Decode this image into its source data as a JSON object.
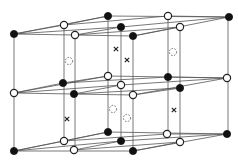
{
  "diagram": {
    "title": "",
    "colors": {
      "background": "#ffffff",
      "line": "#555555",
      "filled": "#111111",
      "open_fill": "#ffffff"
    },
    "radius": 3.6,
    "verticals": [
      {
        "x": 14,
        "y1": 34,
        "y2": 151
      },
      {
        "x": 64,
        "y1": 25,
        "y2": 141
      },
      {
        "x": 75,
        "y1": 35,
        "y2": 150
      },
      {
        "x": 108,
        "y1": 16,
        "y2": 132
      },
      {
        "x": 121,
        "y1": 27,
        "y2": 141
      },
      {
        "x": 133,
        "y1": 36,
        "y2": 151
      },
      {
        "x": 168,
        "y1": 16,
        "y2": 134
      },
      {
        "x": 180,
        "y1": 27,
        "y2": 142
      },
      {
        "x": 228,
        "y1": 17,
        "y2": 134
      }
    ],
    "layers": [
      {
        "name": "top",
        "lines": [
          [
            14,
            34,
            108,
            16
          ],
          [
            14,
            34,
            121,
            27
          ],
          [
            14,
            34,
            133,
            36
          ],
          [
            64,
            25,
            168,
            16
          ],
          [
            75,
            35,
            180,
            27
          ],
          [
            108,
            16,
            229,
            17
          ],
          [
            121,
            27,
            229,
            17
          ],
          [
            133,
            36,
            229,
            17
          ],
          [
            14,
            34,
            64,
            25
          ],
          [
            64,
            25,
            108,
            16
          ],
          [
            75,
            35,
            121,
            27
          ],
          [
            133,
            36,
            180,
            27
          ],
          [
            168,
            16,
            229,
            17
          ]
        ]
      },
      {
        "name": "middle",
        "lines": [
          [
            14,
            93,
            108,
            76
          ],
          [
            14,
            93,
            121,
            85
          ],
          [
            14,
            93,
            133,
            95
          ],
          [
            63,
            83,
            168,
            77
          ],
          [
            74,
            94,
            180,
            88
          ],
          [
            108,
            76,
            227,
            78
          ],
          [
            121,
            85,
            227,
            78
          ],
          [
            133,
            95,
            227,
            78
          ],
          [
            14,
            93,
            63,
            83
          ],
          [
            63,
            83,
            108,
            76
          ],
          [
            74,
            94,
            121,
            85
          ],
          [
            133,
            95,
            180,
            88
          ],
          [
            168,
            77,
            227,
            78
          ]
        ]
      },
      {
        "name": "bottom",
        "lines": [
          [
            14,
            151,
            108,
            132
          ],
          [
            14,
            151,
            121,
            141
          ],
          [
            14,
            151,
            133,
            151
          ],
          [
            64,
            141,
            167,
            134
          ],
          [
            74,
            150,
            180,
            142
          ],
          [
            108,
            132,
            227,
            134
          ],
          [
            121,
            141,
            227,
            134
          ],
          [
            133,
            151,
            227,
            134
          ],
          [
            14,
            151,
            64,
            141
          ],
          [
            64,
            141,
            108,
            132
          ],
          [
            74,
            150,
            121,
            141
          ],
          [
            133,
            151,
            180,
            142
          ],
          [
            167,
            134,
            227,
            134
          ]
        ]
      }
    ],
    "atoms_filled": [
      [
        14,
        34
      ],
      [
        108,
        16
      ],
      [
        121,
        27
      ],
      [
        133,
        36
      ],
      [
        229,
        17
      ],
      [
        63,
        83
      ],
      [
        74,
        94
      ],
      [
        168,
        77
      ],
      [
        180,
        88
      ],
      [
        14,
        151
      ],
      [
        108,
        132
      ],
      [
        121,
        141
      ],
      [
        133,
        151
      ],
      [
        227,
        134
      ]
    ],
    "atoms_open": [
      [
        64,
        25
      ],
      [
        75,
        35
      ],
      [
        168,
        16
      ],
      [
        180,
        27
      ],
      [
        14,
        93
      ],
      [
        108,
        76
      ],
      [
        121,
        85
      ],
      [
        133,
        95
      ],
      [
        227,
        78
      ],
      [
        64,
        141
      ],
      [
        74,
        150
      ],
      [
        167,
        134
      ],
      [
        180,
        142
      ]
    ],
    "sites_dashed": [
      [
        69,
        61
      ],
      [
        173,
        52
      ],
      [
        113,
        109
      ],
      [
        127,
        118
      ]
    ],
    "sites_cross": [
      [
        116,
        49
      ],
      [
        127,
        60
      ],
      [
        67,
        119
      ],
      [
        174,
        110
      ]
    ]
  }
}
